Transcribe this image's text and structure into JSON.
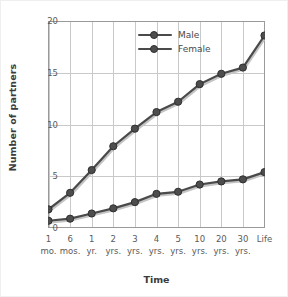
{
  "chart_data": {
    "type": "line",
    "title": "",
    "xlabel": "Time",
    "ylabel": "Number of partners",
    "categories": [
      "1 mo.",
      "6 mos.",
      "1 yr.",
      "2 yrs.",
      "3 yrs.",
      "4 yrs.",
      "5 yrs.",
      "10 yrs.",
      "20 yrs.",
      "30 yrs.",
      "Life"
    ],
    "category_lines": [
      [
        "1",
        "mo."
      ],
      [
        "6",
        "mos."
      ],
      [
        "1",
        "yr."
      ],
      [
        "2",
        "yrs."
      ],
      [
        "3",
        "yrs."
      ],
      [
        "4",
        "yrs."
      ],
      [
        "5",
        "yrs."
      ],
      [
        "10",
        "yrs."
      ],
      [
        "20",
        "yrs."
      ],
      [
        "30",
        "yrs."
      ],
      [
        "Life",
        ""
      ]
    ],
    "series": [
      {
        "name": "Male",
        "values": [
          0.7,
          0.9,
          1.4,
          1.9,
          2.5,
          3.3,
          3.5,
          4.2,
          4.5,
          4.7,
          5.4
        ]
      },
      {
        "name": "Female",
        "values": [
          1.8,
          3.4,
          5.6,
          7.9,
          9.6,
          11.2,
          12.2,
          13.9,
          14.9,
          15.5,
          18.6
        ]
      }
    ],
    "ylim": [
      0,
      20
    ],
    "yticks": [
      0,
      5,
      10,
      15,
      20
    ],
    "ytick_labels": [
      "0",
      "5",
      "10",
      "15",
      "20"
    ],
    "grid": true,
    "legend_position": "top-center",
    "colors": {
      "line": "#4a4a4a",
      "marker_fill": "#4d4d4d",
      "marker_stroke": "#2f2f2f",
      "grid": "#c9c9c9",
      "axis": "#9a9a9a",
      "text": "#5a5a5a",
      "title_text": "#3b3b3b",
      "background": "#ffffff"
    }
  },
  "legend": {
    "items": [
      {
        "label": "Male"
      },
      {
        "label": "Female"
      }
    ]
  }
}
